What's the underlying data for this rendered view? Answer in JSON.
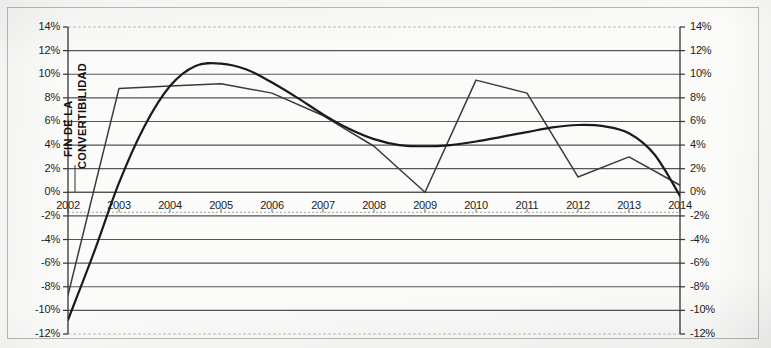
{
  "chart_data": {
    "type": "line",
    "title": "",
    "subtitle": "",
    "xlabel": "",
    "ylabel": "",
    "grid": true,
    "legend_position": "none",
    "xlim": [
      2002,
      2014
    ],
    "ylim": [
      -12,
      14
    ],
    "y_tick_labels": [
      "14%",
      "12%",
      "10%",
      "8%",
      "6%",
      "4%",
      "2%",
      "0%",
      "-2%",
      "-4%",
      "-6%",
      "-8%",
      "-10%",
      "-12%"
    ],
    "y_tick_values": [
      14,
      12,
      10,
      8,
      6,
      4,
      2,
      0,
      -2,
      -4,
      -6,
      -8,
      -10,
      -12
    ],
    "y_tick_labels_right": [
      "14%",
      "12%",
      "10%",
      "8%",
      "6%",
      "4%",
      "2%",
      "0%",
      "-2%",
      "-4%",
      "-6%",
      "-8%",
      "-10%",
      "-12%"
    ],
    "x_tick_labels": [
      "2002",
      "2003",
      "2004",
      "2005",
      "2006",
      "2007",
      "2008",
      "2009",
      "2010",
      "2011",
      "2012",
      "2013",
      "2014"
    ],
    "x_tick_values": [
      2002,
      2003,
      2004,
      2005,
      2006,
      2007,
      2008,
      2009,
      2010,
      2011,
      2012,
      2013,
      2014
    ],
    "series": [
      {
        "name": "serie-anual",
        "style": "jagged",
        "color": "#3a3a3a",
        "x": [
          2002,
          2003,
          2004,
          2005,
          2006,
          2007,
          2008,
          2009,
          2010,
          2011,
          2012,
          2013,
          2014
        ],
        "values": [
          -8.7,
          8.8,
          9.0,
          9.2,
          8.4,
          6.5,
          3.9,
          0.0,
          9.5,
          8.4,
          1.3,
          3.0,
          0.6
        ]
      },
      {
        "name": "tendencia-polinomica",
        "style": "smooth",
        "color": "#1a1a1a",
        "x": [
          2002,
          2002.5,
          2003,
          2003.5,
          2004,
          2004.5,
          2005,
          2005.5,
          2006,
          2006.5,
          2007,
          2007.5,
          2008,
          2008.5,
          2009,
          2009.5,
          2010,
          2010.5,
          2011,
          2011.5,
          2012,
          2012.5,
          2013,
          2013.5,
          2014
        ],
        "values": [
          -10.8,
          -5.2,
          0.8,
          5.6,
          9.0,
          10.7,
          10.9,
          10.4,
          9.3,
          8.0,
          6.6,
          5.4,
          4.5,
          4.0,
          3.9,
          4.0,
          4.3,
          4.7,
          5.1,
          5.5,
          5.7,
          5.6,
          5.0,
          3.2,
          -0.3
        ]
      }
    ],
    "annotations": [
      {
        "name": "fin-convertibilidad",
        "line1": "FIN DE LA",
        "line2": "CONVERTIBILIDAD",
        "x": 2002,
        "has_leader_line": true
      }
    ]
  },
  "axes": {
    "left_axis_name": "eje-y-izquierdo",
    "right_axis_name": "eje-y-derecho",
    "bottom_axis_name": "eje-x-anios"
  }
}
